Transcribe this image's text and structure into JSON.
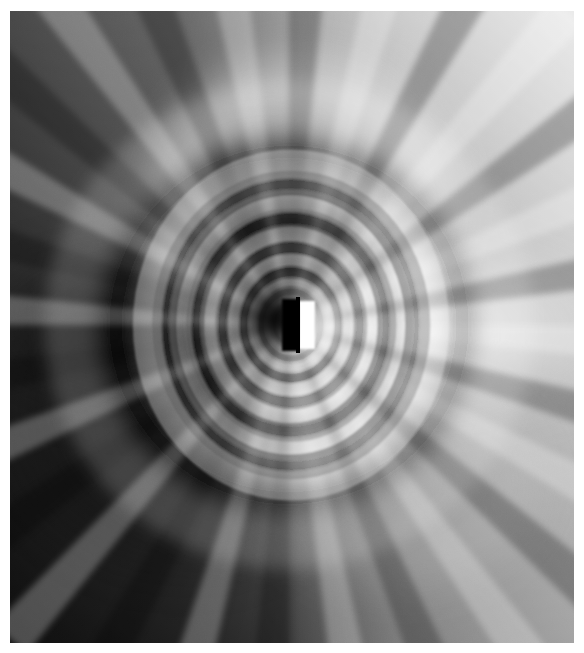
{
  "canvas": {
    "width": 584,
    "height": 653,
    "background_color": "#ffffff",
    "margin_left": 10,
    "margin_top": 11,
    "margin_right": 10,
    "margin_bottom": 10
  },
  "figure": {
    "title": "",
    "type": "grayscale-field-image",
    "description": "Grayscale domain-coloring style plot of a complex field with a dipole singularity",
    "plot_area": {
      "x": 10,
      "y": 11,
      "width": 564,
      "height": 632
    },
    "colormap": {
      "name": "gray",
      "min_color": "#000000",
      "max_color": "#ffffff",
      "mid_color": "#808080"
    }
  },
  "chart_data": {
    "type": "heatmap",
    "title": "",
    "subtitle": "",
    "xlabel": "",
    "ylabel": "",
    "grid": false,
    "legend": "none",
    "xlim": [
      0,
      564
    ],
    "ylim": [
      0,
      632
    ],
    "tick_labels_x": [],
    "tick_labels_y": [],
    "singularity": {
      "label": "pole",
      "x": 289,
      "y": 325,
      "core_half_width": 6,
      "core_half_height": 26,
      "dark_side": "left",
      "bright_side": "right"
    },
    "global_gradient": {
      "description": "bright toward upper-right, dark toward lower-left",
      "corner_values": {
        "top_left": 128,
        "top_right": 205,
        "bottom_left": 38,
        "bottom_right": 115
      },
      "edge_values": {
        "top_center": 150,
        "bottom_center": 100,
        "left_center": 60,
        "right_center": 228
      }
    },
    "lobes": [
      {
        "name": "upper-dark-crescent",
        "center_x": 265,
        "center_y": 235,
        "radius_x": 95,
        "radius_y": 105,
        "value": 42
      },
      {
        "name": "upper-bright-halo",
        "center_x": 300,
        "center_y": 200,
        "radius_x": 150,
        "radius_y": 145,
        "value": 215
      },
      {
        "name": "lower-bright-crescent",
        "center_x": 315,
        "center_y": 415,
        "radius_x": 90,
        "radius_y": 95,
        "value": 228
      },
      {
        "name": "lower-dark-wedge",
        "center_x": 170,
        "center_y": 430,
        "radius_x": 160,
        "radius_y": 130,
        "value": 28
      },
      {
        "name": "right-bright-ray-fan",
        "center_x": 430,
        "center_y": 330,
        "radius_x": 160,
        "radius_y": 70,
        "value": 240
      },
      {
        "name": "left-dark-ray-fan",
        "center_x": 140,
        "center_y": 330,
        "radius_x": 160,
        "radius_y": 70,
        "value": 22
      }
    ],
    "rays": {
      "count": 28,
      "description": "alternating light and dark rays radiating from the pole, densest near the core",
      "inner_radius": 6,
      "outer_radius": 420
    },
    "rings": {
      "count": 9,
      "description": "concentric phase rings around the pole forming nested crescents",
      "radii": [
        14,
        24,
        38,
        56,
        78,
        104,
        136,
        175,
        220
      ]
    },
    "noise": {
      "present": true,
      "amplitude": 4,
      "description": "faint dithering / quantization texture across the whole field"
    }
  }
}
